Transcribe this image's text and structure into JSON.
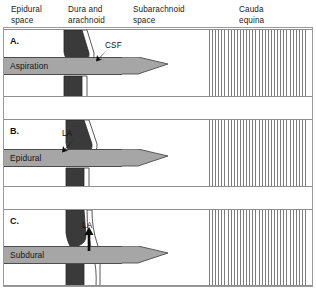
{
  "figure": {
    "width": 316,
    "height": 290,
    "colors": {
      "dura_dark": "#3a3a3a",
      "arachnoid_light": "#ffffff",
      "syringe_gray": "#a6a6a6",
      "cauda_stripe": "#7d7d7d",
      "frame_border": "#9a9a9a",
      "text": "#1a1a1a"
    }
  },
  "headers": [
    {
      "id": "epidural",
      "label": "Epidural\nspace"
    },
    {
      "id": "dura",
      "label": "Dura and\narachnoid"
    },
    {
      "id": "subarachnoid",
      "label": "Subarachnoid\nspace"
    },
    {
      "id": "cauda",
      "label": "Cauda\nequina"
    }
  ],
  "panels": [
    {
      "id": "a",
      "letter": "A.",
      "syringe_label": "Aspiration",
      "annotation": {
        "text": "CSF",
        "arrow": "down-left"
      },
      "description": "Needle tip past the dura and arachnoid in the subarachnoid space; aspiration yields CSF."
    },
    {
      "id": "b",
      "letter": "B.",
      "syringe_label": "Epidural",
      "annotation": {
        "text": "LA",
        "arrow": "down-left"
      },
      "description": "Needle tip in the epidural space; local anaesthetic spreads outside the dura."
    },
    {
      "id": "c",
      "letter": "C.",
      "syringe_label": "Subdural",
      "annotation": {
        "text": "LA",
        "arrow": "up"
      },
      "description": "Needle tip between dura and arachnoid; local anaesthetic tracks in the subdural space."
    }
  ]
}
